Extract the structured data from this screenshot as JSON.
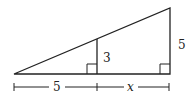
{
  "diagram": {
    "type": "similar-triangles",
    "labels": {
      "inner_height": "3",
      "outer_height": "5",
      "left_base": "5",
      "right_base": "x"
    },
    "stroke_color": "#222222",
    "background": "#ffffff"
  }
}
